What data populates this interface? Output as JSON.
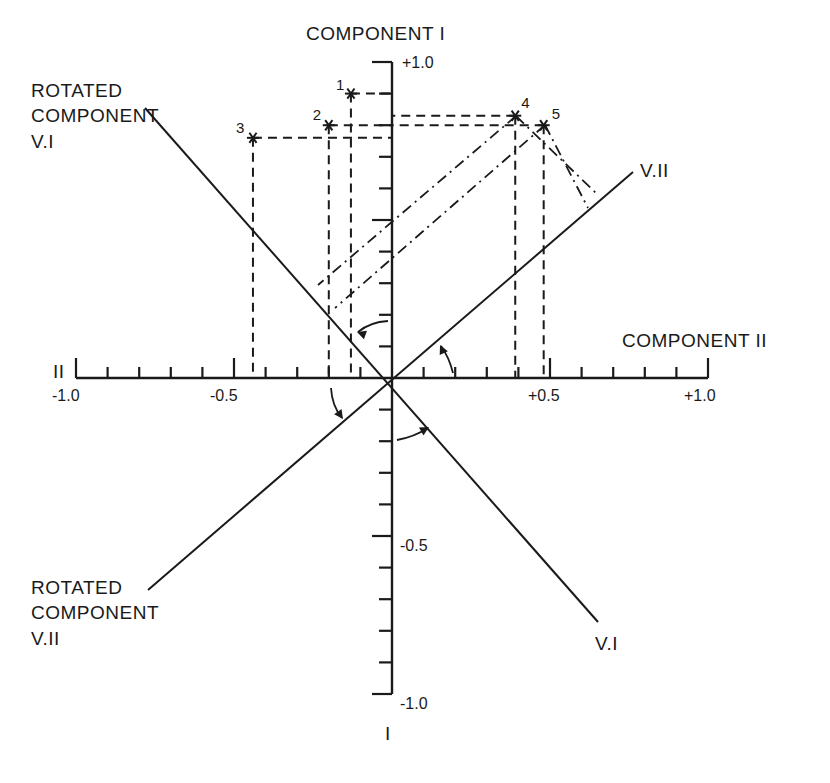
{
  "figure": {
    "vertical_axis_title": "COMPONENT I",
    "vertical_axis_end_label": "I",
    "horizontal_axis_title": "COMPONENT II",
    "horizontal_axis_end_label": "II",
    "rotated_v1_title_lines": [
      "ROTATED",
      "COMPONENT",
      "V.I"
    ],
    "rotated_v2_title_lines": [
      "ROTATED",
      "COMPONENT",
      "V.II"
    ],
    "rotated_v1_end_label": "V.I",
    "rotated_v2_end_label": "V.II",
    "x_tick_labels": [
      "-1.0",
      "-0.5",
      "+0.5",
      "+1.0"
    ],
    "y_tick_labels": [
      "+1.0",
      "-0.5",
      "-1.0"
    ]
  },
  "chart_data": {
    "type": "scatter",
    "xlabel": "COMPONENT II",
    "ylabel": "COMPONENT I",
    "xlim": [
      -1.0,
      1.0
    ],
    "ylim": [
      -1.0,
      1.0
    ],
    "x_ticks": [
      -1.0,
      -0.9,
      -0.8,
      -0.7,
      -0.6,
      -0.5,
      -0.4,
      -0.3,
      -0.2,
      -0.1,
      0,
      0.1,
      0.2,
      0.3,
      0.4,
      0.5,
      0.6,
      0.7,
      0.8,
      0.9,
      1.0
    ],
    "y_ticks": [
      -1.0,
      -0.9,
      -0.8,
      -0.7,
      -0.6,
      -0.5,
      -0.4,
      -0.3,
      -0.2,
      -0.1,
      0,
      0.1,
      0.2,
      0.3,
      0.4,
      0.5,
      0.6,
      0.7,
      0.8,
      0.9,
      1.0
    ],
    "x_tick_labels": {
      "-1.0": "-1.0",
      "-0.5": "-0.5",
      "0.5": "+0.5",
      "1.0": "+1.0"
    },
    "y_tick_labels": {
      "1.0": "+1.0",
      "-0.5": "-0.5",
      "-1.0": "-1.0"
    },
    "grid": false,
    "points": [
      {
        "label": "1",
        "x": -0.13,
        "y": 0.9
      },
      {
        "label": "2",
        "x": -0.2,
        "y": 0.8
      },
      {
        "label": "3",
        "x": -0.44,
        "y": 0.76
      },
      {
        "label": "4",
        "x": 0.39,
        "y": 0.83
      },
      {
        "label": "5",
        "x": 0.48,
        "y": 0.8
      }
    ],
    "rotated_axes": [
      {
        "name": "V.I",
        "label": "ROTATED COMPONENT V.I",
        "angle_deg": 135
      },
      {
        "name": "V.II",
        "label": "ROTATED COMPONENT V.II",
        "angle_deg": 45
      }
    ],
    "projections": {
      "dashed_to_original_axes": [
        "1",
        "2",
        "3",
        "4",
        "5"
      ],
      "dash_dot_to_rotated_axes": [
        "4",
        "5"
      ]
    },
    "rotation_arrows": 4
  }
}
